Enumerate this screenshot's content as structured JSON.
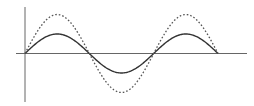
{
  "chart_data": {
    "type": "line",
    "title": "",
    "xlabel": "",
    "ylabel": "",
    "x_unit": "radians",
    "xlim": [
      0,
      9.4248
    ],
    "ylim": [
      -1.0,
      1.0
    ],
    "grid": false,
    "legend": "none",
    "series": [
      {
        "name": "solid-sine",
        "style": "solid",
        "color": "#333333",
        "function": "A*sin(x)",
        "amplitude": 0.5,
        "x": [
          0,
          0.7854,
          1.5708,
          2.3562,
          3.1416,
          3.927,
          4.7124,
          5.4978,
          6.2832,
          7.0686,
          7.854,
          8.6394,
          9.4248
        ],
        "values": [
          0,
          0.354,
          0.5,
          0.354,
          0,
          -0.354,
          -0.5,
          -0.354,
          0,
          0.354,
          0.5,
          0.354,
          0
        ]
      },
      {
        "name": "dashed-sine",
        "style": "dotted",
        "color": "#555555",
        "function": "A*sin(x)",
        "amplitude": 1.0,
        "x": [
          0,
          0.7854,
          1.5708,
          2.3562,
          3.1416,
          3.927,
          4.7124,
          5.4978,
          6.2832,
          7.0686,
          7.854,
          8.6394,
          9.4248
        ],
        "values": [
          0,
          0.707,
          1.0,
          0.707,
          0,
          -0.707,
          -1.0,
          -0.707,
          0,
          0.707,
          1.0,
          0.707,
          0
        ]
      }
    ],
    "axis_color": "#666666"
  }
}
